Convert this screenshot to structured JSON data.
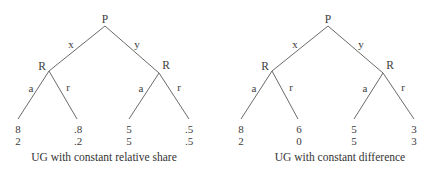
{
  "diagrams": [
    {
      "caption": "UG with constant relative share",
      "root": {
        "label": "P"
      },
      "edges_top": {
        "left": "x",
        "right": "y"
      },
      "responders": [
        {
          "label": "R",
          "edges": {
            "left": "a",
            "right": "r"
          },
          "payoffs": [
            {
              "top": "8",
              "bottom": "2"
            },
            {
              "top": ".8",
              "bottom": ".2"
            }
          ]
        },
        {
          "label": "R",
          "edges": {
            "left": "a",
            "right": "r"
          },
          "payoffs": [
            {
              "top": "5",
              "bottom": "5"
            },
            {
              "top": ".5",
              "bottom": ".5"
            }
          ]
        }
      ]
    },
    {
      "caption": "UG with constant difference",
      "root": {
        "label": "P"
      },
      "edges_top": {
        "left": "x",
        "right": "y"
      },
      "responders": [
        {
          "label": "R",
          "edges": {
            "left": "a",
            "right": "r"
          },
          "payoffs": [
            {
              "top": "8",
              "bottom": "2"
            },
            {
              "top": "6",
              "bottom": "0"
            }
          ]
        },
        {
          "label": "R",
          "edges": {
            "left": "a",
            "right": "r"
          },
          "payoffs": [
            {
              "top": "5",
              "bottom": "5"
            },
            {
              "top": "3",
              "bottom": "3"
            }
          ]
        }
      ]
    }
  ],
  "colors": {
    "line": "#6a6a6a",
    "text": "#3a3a3a",
    "background": "#ffffff"
  }
}
